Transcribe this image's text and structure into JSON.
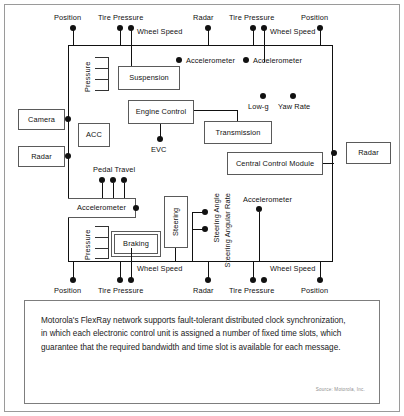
{
  "figure": {
    "bus": {
      "label": "FlexRay bus"
    },
    "ecus": [
      {
        "name": "camera",
        "label": "Camera"
      },
      {
        "name": "radar-left",
        "label": "Radar"
      },
      {
        "name": "acc",
        "label": "ACC"
      },
      {
        "name": "suspension",
        "label": "Suspension"
      },
      {
        "name": "engine-control",
        "label": "Engine Control"
      },
      {
        "name": "transmission",
        "label": "Transmission"
      },
      {
        "name": "central-control-module",
        "label": "Central Control Module"
      },
      {
        "name": "radar-right",
        "label": "Radar"
      },
      {
        "name": "accelerometer-ecu",
        "label": "Accelerometer"
      },
      {
        "name": "braking",
        "label": "Braking"
      },
      {
        "name": "steering",
        "label": "Steering"
      }
    ],
    "sensors_top": [
      {
        "name": "position-top-left",
        "label": "Position"
      },
      {
        "name": "tire-pressure-top-left",
        "label": "Tire Pressure"
      },
      {
        "name": "wheel-speed-top-left",
        "label": "Wheel Speed"
      },
      {
        "name": "radar-top",
        "label": "Radar"
      },
      {
        "name": "tire-pressure-top-right",
        "label": "Tire Pressure"
      },
      {
        "name": "wheel-speed-top-right",
        "label": "Wheel Speed"
      },
      {
        "name": "position-top-right",
        "label": "Position"
      },
      {
        "name": "accelerometer-top-left",
        "label": "Accelerometer"
      },
      {
        "name": "accelerometer-top-right",
        "label": "Accelerometer"
      }
    ],
    "sensors_bottom": [
      {
        "name": "position-bottom-left",
        "label": "Position"
      },
      {
        "name": "tire-pressure-bottom-left",
        "label": "Tire Pressure"
      },
      {
        "name": "wheel-speed-bottom-left",
        "label": "Wheel Speed"
      },
      {
        "name": "radar-bottom",
        "label": "Radar"
      },
      {
        "name": "tire-pressure-bottom-right",
        "label": "Tire Pressure"
      },
      {
        "name": "wheel-speed-bottom-right",
        "label": "Wheel Speed"
      },
      {
        "name": "position-bottom-right",
        "label": "Position"
      }
    ],
    "sensors_inner": [
      {
        "name": "pressure-top",
        "label": "Pressure"
      },
      {
        "name": "pressure-bottom",
        "label": "Pressure"
      },
      {
        "name": "low-g",
        "label": "Low-g"
      },
      {
        "name": "yaw-rate",
        "label": "Yaw Rate"
      },
      {
        "name": "evc",
        "label": "EVC"
      },
      {
        "name": "pedal-travel",
        "label": "Pedal Travel"
      },
      {
        "name": "steering-angle",
        "label": "Steering Angle"
      },
      {
        "name": "steering-angular-rate",
        "label": "Steering Angular Rate"
      },
      {
        "name": "accelerometer-bottom-right",
        "label": "Accelerometer"
      }
    ]
  },
  "caption": {
    "body": "Motorola's FlexRay network supports fault-tolerant distributed clock synchronization, in which each electronic control unit is assigned a number of fixed time slots, which guarantee that the required bandwidth and time slot is available for each message.",
    "source": "Source: Motorola, Inc."
  }
}
